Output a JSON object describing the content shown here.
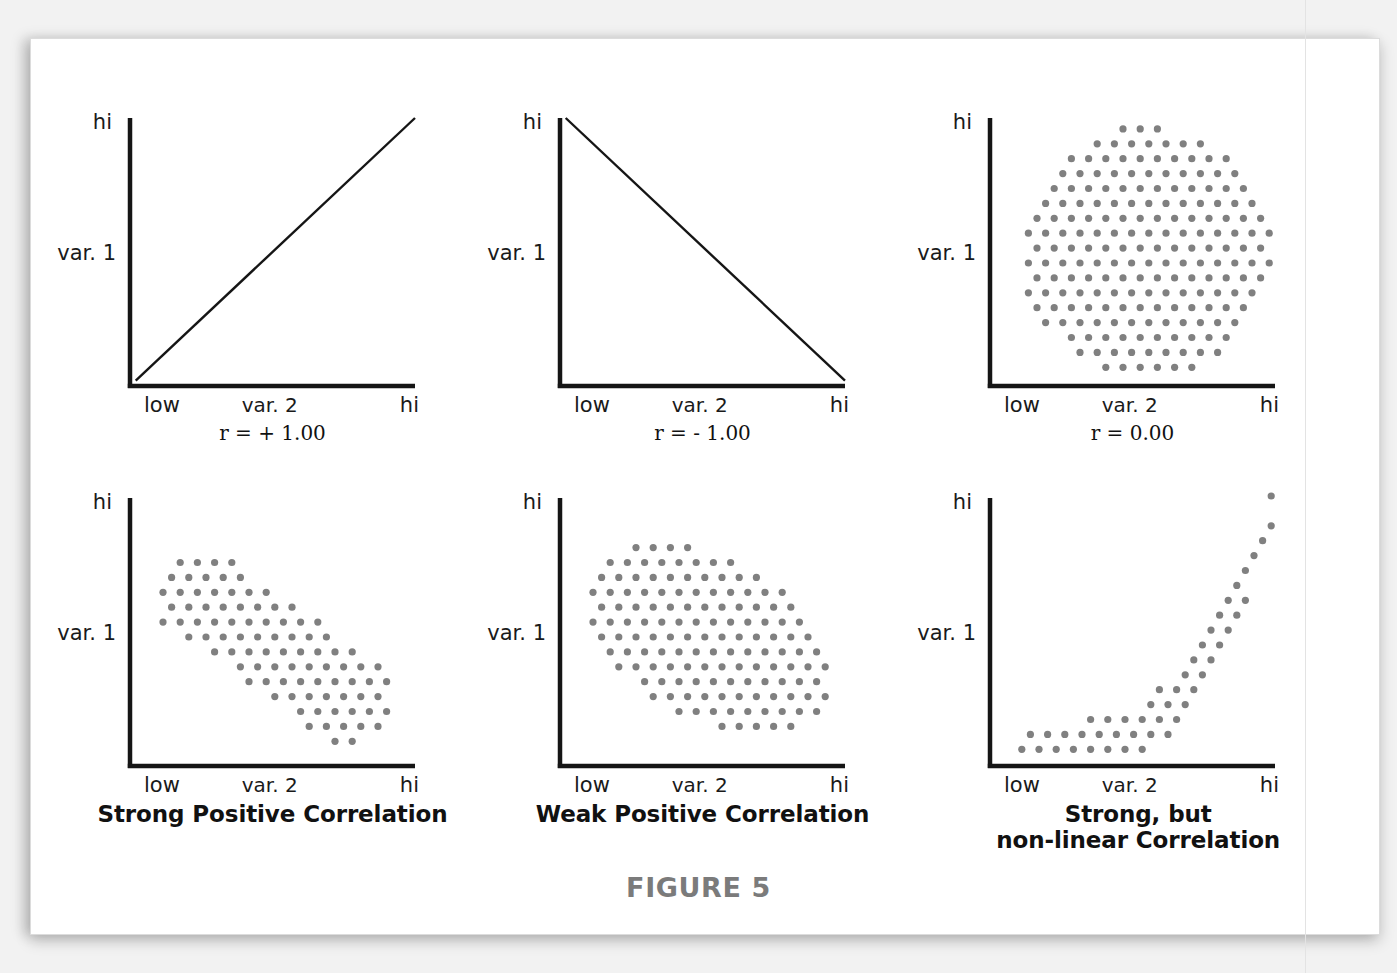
{
  "figure": {
    "number_label": "FIGURE 5",
    "axis": {
      "y_top_label": "hi",
      "y_name_label": "var. 1",
      "x_left_label": "low",
      "x_name_label": "var. 2",
      "x_right_label": "hi"
    },
    "colors": {
      "axis_line": "#151515",
      "dot": "#808080",
      "text": "#1a1a1a",
      "figure_number": "#7b7b7b",
      "paper": "#ffffff",
      "backdrop": "#f2f2f2"
    }
  },
  "panels": [
    {
      "id": "panel-r-plus-1",
      "name": "perfect-positive-correlation",
      "y_label": "hi",
      "y_name": "var. 1",
      "x_left": "low",
      "x_name": "var. 2",
      "x_right": "hi",
      "sub_label": "r = + 1.00",
      "caption": "",
      "plot_kind": "line"
    },
    {
      "id": "panel-r-minus-1",
      "name": "perfect-negative-correlation",
      "y_label": "hi",
      "y_name": "var. 1",
      "x_left": "low",
      "x_name": "var. 2",
      "x_right": "hi",
      "sub_label": "r = - 1.00",
      "caption": "",
      "plot_kind": "line"
    },
    {
      "id": "panel-r-zero",
      "name": "no-correlation",
      "y_label": "hi",
      "y_name": "var. 1",
      "x_left": "low",
      "x_name": "var. 2",
      "x_right": "hi",
      "sub_label": "r = 0.00",
      "caption": "",
      "plot_kind": "scatter"
    },
    {
      "id": "panel-strong-positive",
      "name": "strong-positive-correlation",
      "y_label": "hi",
      "y_name": "var. 1",
      "x_left": "low",
      "x_name": "var. 2",
      "x_right": "hi",
      "sub_label": "",
      "caption": "Strong Positive Correlation",
      "plot_kind": "scatter"
    },
    {
      "id": "panel-weak-positive",
      "name": "weak-positive-correlation",
      "y_label": "hi",
      "y_name": "var. 1",
      "x_left": "low",
      "x_name": "var. 2",
      "x_right": "hi",
      "sub_label": "",
      "caption": "Weak Positive Correlation",
      "plot_kind": "scatter"
    },
    {
      "id": "panel-non-linear",
      "name": "strong-non-linear-correlation",
      "y_label": "hi",
      "y_name": "var. 1",
      "x_left": "low",
      "x_name": "var. 2",
      "x_right": "hi",
      "sub_label": "",
      "caption_line1": "Strong, but",
      "caption_line2": "non-linear Correlation",
      "caption": "Strong, but non-linear Correlation",
      "plot_kind": "scatter"
    }
  ],
  "chart_data": [
    {
      "type": "line",
      "title": "r = + 1.00",
      "xlabel": "var. 2",
      "ylabel": "var. 1",
      "xticklabels": [
        "low",
        "hi"
      ],
      "yticklabels": [
        "hi"
      ],
      "xlim": [
        0,
        1
      ],
      "ylim": [
        0,
        1
      ],
      "grid": false,
      "legend": "none",
      "r": 1.0,
      "x": [
        0.02,
        1.0
      ],
      "y": [
        0.02,
        1.0
      ],
      "annotation": "r = + 1.00"
    },
    {
      "type": "line",
      "title": "r = - 1.00",
      "xlabel": "var. 2",
      "ylabel": "var. 1",
      "xticklabels": [
        "low",
        "hi"
      ],
      "yticklabels": [
        "hi"
      ],
      "xlim": [
        0,
        1
      ],
      "ylim": [
        0,
        1
      ],
      "grid": false,
      "legend": "none",
      "r": -1.0,
      "x": [
        0.02,
        1.0
      ],
      "y": [
        1.0,
        0.02
      ],
      "annotation": "r = - 1.00"
    },
    {
      "type": "scatter",
      "title": "r = 0.00",
      "xlabel": "var. 2",
      "ylabel": "var. 1",
      "xticklabels": [
        "low",
        "hi"
      ],
      "yticklabels": [
        "hi"
      ],
      "xlim": [
        0,
        1
      ],
      "ylim": [
        0,
        1
      ],
      "grid": false,
      "legend": "none",
      "r": 0.0,
      "cloud_shape": "circle",
      "cloud_center": [
        0.55,
        0.5
      ],
      "cloud_radius_x": 0.44,
      "cloud_radius_y": 0.47,
      "cloud_angle_deg": 0,
      "approx_point_count": 400,
      "annotation": "r = 0.00"
    },
    {
      "type": "scatter",
      "title": "Strong Positive Correlation",
      "xlabel": "var. 2",
      "ylabel": "var. 1",
      "xticklabels": [
        "low",
        "hi"
      ],
      "yticklabels": [
        "hi"
      ],
      "xlim": [
        0,
        1
      ],
      "ylim": [
        0,
        1
      ],
      "grid": false,
      "legend": "none",
      "r": 0.9,
      "cloud_shape": "tilted-capsule",
      "cloud_center": [
        0.5,
        0.45
      ],
      "cloud_radius_x": 0.48,
      "cloud_radius_y": 0.17,
      "cloud_angle_deg": 35,
      "approx_point_count": 240,
      "annotation": "Strong Positive Correlation"
    },
    {
      "type": "scatter",
      "title": "Weak Positive Correlation",
      "xlabel": "var. 2",
      "ylabel": "var. 1",
      "xticklabels": [
        "low",
        "hi"
      ],
      "yticklabels": [
        "hi"
      ],
      "xlim": [
        0,
        1
      ],
      "ylim": [
        0,
        1
      ],
      "grid": false,
      "legend": "none",
      "r": 0.5,
      "cloud_shape": "tilted-ellipse",
      "cloud_center": [
        0.52,
        0.48
      ],
      "cloud_radius_x": 0.47,
      "cloud_radius_y": 0.3,
      "cloud_angle_deg": 30,
      "approx_point_count": 290,
      "annotation": "Weak Positive Correlation"
    },
    {
      "type": "scatter",
      "title": "Strong, but non-linear Correlation",
      "xlabel": "var. 2",
      "ylabel": "var. 1",
      "xticklabels": [
        "low",
        "hi"
      ],
      "yticklabels": [
        "hi"
      ],
      "xlim": [
        0,
        1
      ],
      "ylim": [
        0,
        1
      ],
      "grid": false,
      "legend": "none",
      "r": 0.0,
      "cloud_shape": "j-curve",
      "curve_formula": "y = 0.06 + 0.95 * (max(0,(x-0.12))/0.88)^3.2",
      "band_half_width": 0.085,
      "x_range": [
        0.12,
        1.0
      ],
      "approx_point_count": 165,
      "annotation": "Strong, but non-linear Correlation"
    }
  ]
}
